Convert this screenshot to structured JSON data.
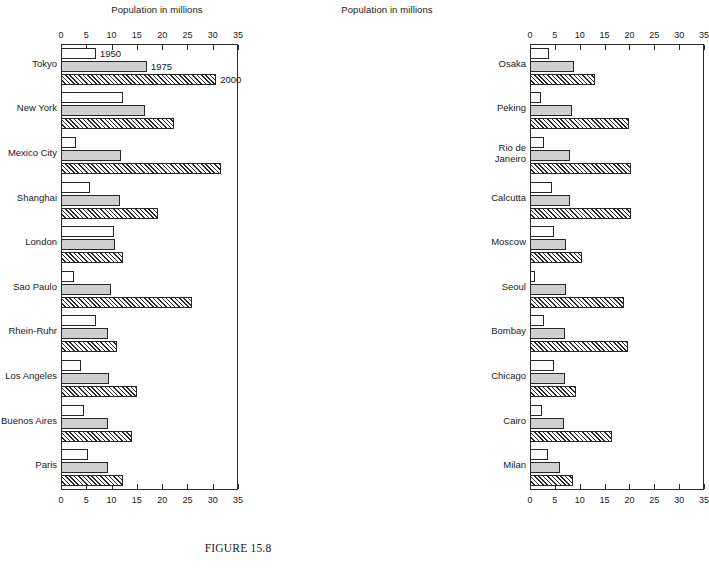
{
  "caption": "FIGURE 15.8",
  "axis_title": "Population in millions",
  "tick_labels": [
    "0",
    "5",
    "10",
    "15",
    "20",
    "25",
    "30",
    "35"
  ],
  "series_notes": {
    "n1950": "1950",
    "n1975": "1975",
    "n2000": "2000"
  },
  "chart_data": {
    "type": "bar",
    "orientation": "horizontal",
    "title": "FIGURE 15.8",
    "xlabel": "Population in millions",
    "ylabel": "",
    "xlim": [
      0,
      35
    ],
    "xticks": [
      0,
      5,
      10,
      15,
      20,
      25,
      30,
      35
    ],
    "grid": false,
    "legend": [
      "1950",
      "1975",
      "2000"
    ],
    "legend_position": "inline-annotations-on-first-group",
    "panels": [
      {
        "name": "left",
        "categories": [
          "Tokyo",
          "New York",
          "Mexico City",
          "Shanghai",
          "London",
          "Sao Paulo",
          "Rhein-Ruhr",
          "Los Angeles",
          "Buenos Aires",
          "Paris"
        ],
        "series": [
          {
            "name": "1950",
            "values": [
              6.9,
              12.3,
              2.9,
              5.8,
              10.4,
              2.5,
              6.9,
              4.0,
              4.5,
              5.4
            ]
          },
          {
            "name": "1975",
            "values": [
              17.0,
              16.6,
              11.9,
              11.6,
              10.7,
              9.9,
              9.3,
              9.5,
              9.3,
              9.3
            ]
          },
          {
            "name": "2000",
            "values": [
              30.7,
              22.4,
              31.6,
              19.2,
              12.3,
              26.0,
              11.1,
              15.0,
              14.0,
              12.3
            ]
          }
        ]
      },
      {
        "name": "right",
        "categories": [
          "Osaka",
          "Peking",
          "Rio de\nJaneiro",
          "Calcutta",
          "Moscow",
          "Seoul",
          "Bombay",
          "Chicago",
          "Cairo",
          "Milan"
        ],
        "series": [
          {
            "name": "1950",
            "values": [
              3.8,
              2.2,
              2.9,
              4.4,
              4.8,
              1.0,
              2.9,
              4.9,
              2.4,
              3.6
            ]
          },
          {
            "name": "1975",
            "values": [
              8.8,
              8.5,
              8.0,
              8.0,
              7.3,
              7.3,
              7.1,
              7.1,
              6.9,
              6.1
            ]
          },
          {
            "name": "2000",
            "values": [
              13.0,
              19.9,
              20.3,
              20.4,
              10.4,
              19.0,
              19.8,
              9.3,
              16.4,
              8.6
            ]
          }
        ]
      }
    ]
  }
}
